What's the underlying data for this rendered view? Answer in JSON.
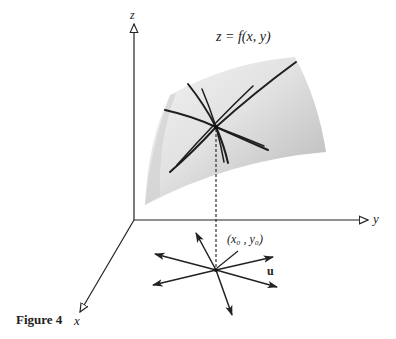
{
  "figure": {
    "caption": "Figure 4",
    "equation": "z = f(x, y)",
    "axes": {
      "x_label": "x",
      "y_label": "y",
      "z_label": "z"
    },
    "point_label": "(x₀ , y₀)",
    "vector_label": "u"
  },
  "colors": {
    "ink": "#222222",
    "surface_light": "#f0f0f0",
    "surface_dark": "#b8b8b8"
  }
}
